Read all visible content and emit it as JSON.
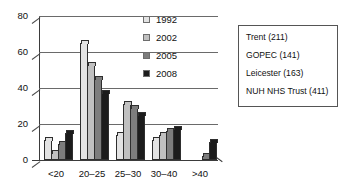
{
  "chart_data": {
    "type": "bar",
    "title": "",
    "xlabel": "",
    "ylabel": "",
    "categories": [
      "<20",
      "20–25",
      "25–30",
      "30–40",
      ">40"
    ],
    "series": [
      {
        "name": "1992",
        "color": "#e3e3e3",
        "values": [
          11,
          65,
          14,
          11,
          0
        ]
      },
      {
        "name": "2002",
        "color": "#c0c0c0",
        "values": [
          4,
          53,
          31,
          14,
          0
        ]
      },
      {
        "name": "2005",
        "color": "#7d7d7d",
        "values": [
          9,
          45,
          29,
          16,
          2
        ]
      },
      {
        "name": "2008",
        "color": "#1c1c1c",
        "values": [
          15,
          37,
          25,
          17,
          10
        ]
      }
    ],
    "ylim": [
      0,
      80
    ],
    "yticks": [
      "0",
      "20",
      "40",
      "60",
      "80"
    ],
    "ytick_values": [
      0,
      20,
      40,
      60,
      80
    ],
    "grid": true,
    "legend_position": "top-right",
    "legend_entries": [
      "1992",
      "2002",
      "2005",
      "2008"
    ]
  },
  "legend": {
    "items": [
      {
        "label": "1992",
        "swatch": "legend-swatch-1992"
      },
      {
        "label": "2002",
        "swatch": "legend-swatch-2002"
      },
      {
        "label": "2005",
        "swatch": "legend-swatch-2005"
      },
      {
        "label": "2008",
        "swatch": "legend-swatch-2008"
      }
    ]
  },
  "notebox": {
    "lines": [
      "Trent (211)",
      "GOPEC (141)",
      "Leicester (163)",
      "NUH NHS Trust (411)"
    ]
  }
}
